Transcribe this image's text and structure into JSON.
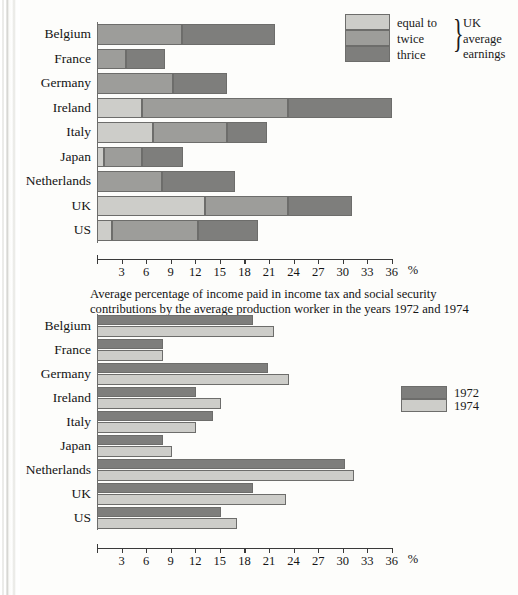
{
  "page": {
    "caption": "Average percentage of income paid in income tax and social security contributions by the average production worker in the years 1972 and 1974"
  },
  "chart_data": [
    {
      "type": "bar",
      "orientation": "horizontal",
      "stacked": true,
      "title": "",
      "xlabel": "%",
      "ylabel": "",
      "xlim": [
        0,
        36
      ],
      "xticks": [
        3,
        6,
        9,
        12,
        15,
        18,
        21,
        24,
        27,
        30,
        33,
        36
      ],
      "grid": false,
      "legend_position": "top-right",
      "legend_bracket_label": "UK average earnings",
      "categories": [
        "Belgium",
        "France",
        "Germany",
        "Ireland",
        "Italy",
        "Japan",
        "Netherlands",
        "UK",
        "US"
      ],
      "series": [
        {
          "name": "equal to",
          "color": "#cdcdc9",
          "values": [
            0.0,
            0.0,
            0.0,
            5.5,
            6.8,
            0.8,
            0.0,
            13.2,
            1.8
          ]
        },
        {
          "name": "twice",
          "color": "#9d9d9a",
          "values": [
            10.4,
            3.5,
            9.3,
            23.3,
            15.9,
            5.5,
            7.9,
            23.3,
            12.3
          ]
        },
        {
          "name": "thrice",
          "color": "#7e7e7c",
          "values": [
            21.7,
            8.3,
            15.9,
            36.0,
            20.8,
            10.5,
            16.9,
            31.1,
            19.6
          ]
        }
      ],
      "note": "series values are cumulative stack edges in percent"
    },
    {
      "type": "bar",
      "orientation": "horizontal",
      "stacked": false,
      "title": "",
      "xlabel": "%",
      "ylabel": "",
      "xlim": [
        0,
        36
      ],
      "xticks": [
        3,
        6,
        9,
        12,
        15,
        18,
        21,
        24,
        27,
        30,
        33,
        36
      ],
      "grid": false,
      "legend_position": "right",
      "categories": [
        "Belgium",
        "France",
        "Germany",
        "Ireland",
        "Italy",
        "Japan",
        "Netherlands",
        "UK",
        "US"
      ],
      "series": [
        {
          "name": "1972",
          "color": "#7e7e7c",
          "values": [
            19.0,
            8.0,
            20.9,
            12.1,
            14.2,
            8.0,
            30.3,
            19.1,
            15.1
          ]
        },
        {
          "name": "1974",
          "color": "#cdcdc9",
          "values": [
            21.6,
            8.1,
            23.4,
            15.1,
            12.1,
            9.1,
            31.4,
            23.1,
            17.1
          ]
        }
      ]
    }
  ],
  "colors": {
    "light": "#cdcdc9",
    "medium": "#9d9d9a",
    "dark": "#7e7e7c",
    "stroke": "#6d6d6b",
    "text": "#141414",
    "page": "#fdfdfb"
  }
}
